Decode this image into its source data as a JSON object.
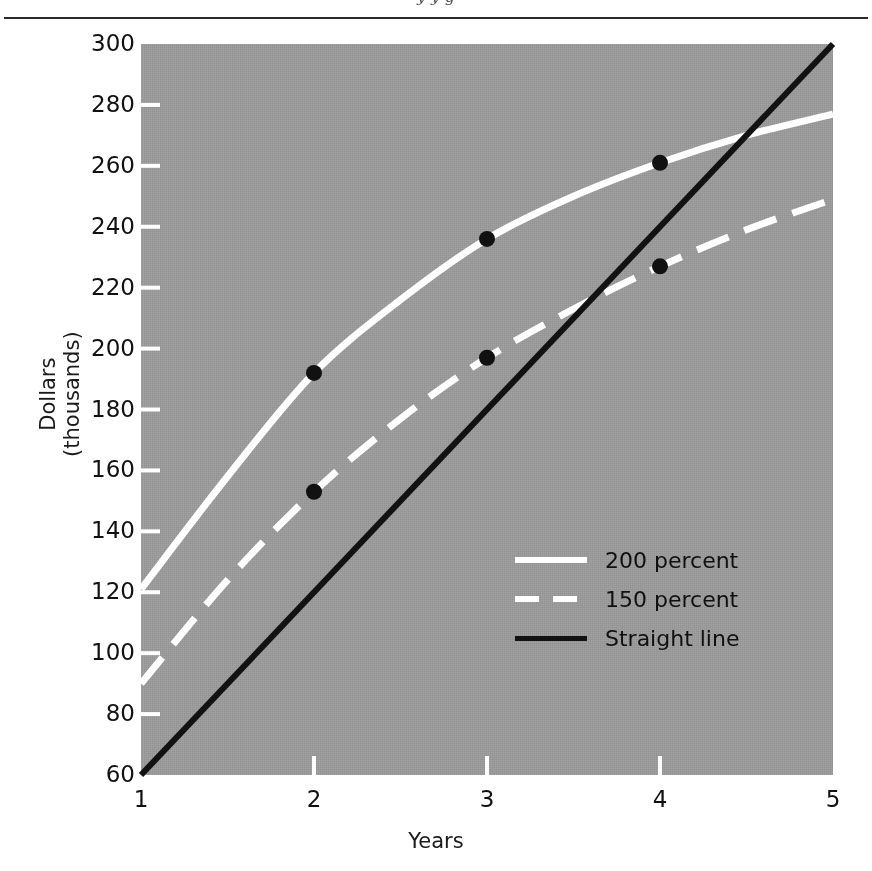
{
  "page": {
    "running_head": "y  y  g",
    "background_color": "#ffffff"
  },
  "chart_data": {
    "type": "line",
    "title": "",
    "xlabel": "Years",
    "ylabel": "Dollars (thousands)",
    "ylabel_line1": "Dollars",
    "ylabel_line2": "(thousands)",
    "xlim": [
      1,
      5
    ],
    "ylim": [
      60,
      300
    ],
    "xticks": [
      1,
      2,
      3,
      4,
      5
    ],
    "yticks": [
      60,
      80,
      100,
      120,
      140,
      160,
      180,
      200,
      220,
      240,
      260,
      280,
      300
    ],
    "xtick_labels": [
      "1",
      "2",
      "3",
      "4",
      "5"
    ],
    "ytick_labels": [
      "60",
      "80",
      "100",
      "120",
      "140",
      "160",
      "180",
      "200",
      "220",
      "240",
      "260",
      "280",
      "300"
    ],
    "grid": false,
    "plot_background_color": "#9a9a9a",
    "legend_position": "center-right",
    "series": [
      {
        "name": "200 percent",
        "style": "solid",
        "color": "#ffffff",
        "x": [
          1,
          1.5,
          2,
          2.5,
          3,
          3.5,
          4,
          4.5,
          5
        ],
        "values": [
          121,
          158,
          192,
          216,
          236,
          250,
          261,
          270,
          277
        ],
        "markers": [
          {
            "x": 2,
            "y": 192
          },
          {
            "x": 3,
            "y": 236
          },
          {
            "x": 4,
            "y": 261
          }
        ],
        "marker_color": "#111111"
      },
      {
        "name": "150 percent",
        "style": "dashed",
        "color": "#ffffff",
        "x": [
          1,
          1.5,
          2,
          2.5,
          3,
          3.5,
          4,
          4.5,
          5
        ],
        "values": [
          90,
          124,
          153,
          177,
          197,
          213,
          227,
          239,
          249
        ],
        "markers": [
          {
            "x": 2,
            "y": 153
          },
          {
            "x": 3,
            "y": 197
          },
          {
            "x": 4,
            "y": 227
          }
        ],
        "marker_color": "#111111"
      },
      {
        "name": "Straight line",
        "style": "solid",
        "color": "#121212",
        "x": [
          1,
          5
        ],
        "values": [
          60,
          300
        ],
        "markers": [],
        "marker_color": "#111111"
      }
    ],
    "legend": [
      {
        "label": "200 percent",
        "style": "solid",
        "color": "#ffffff"
      },
      {
        "label": "150 percent",
        "style": "dashed",
        "color": "#ffffff"
      },
      {
        "label": "Straight line",
        "style": "solid",
        "color": "#121212"
      }
    ]
  }
}
